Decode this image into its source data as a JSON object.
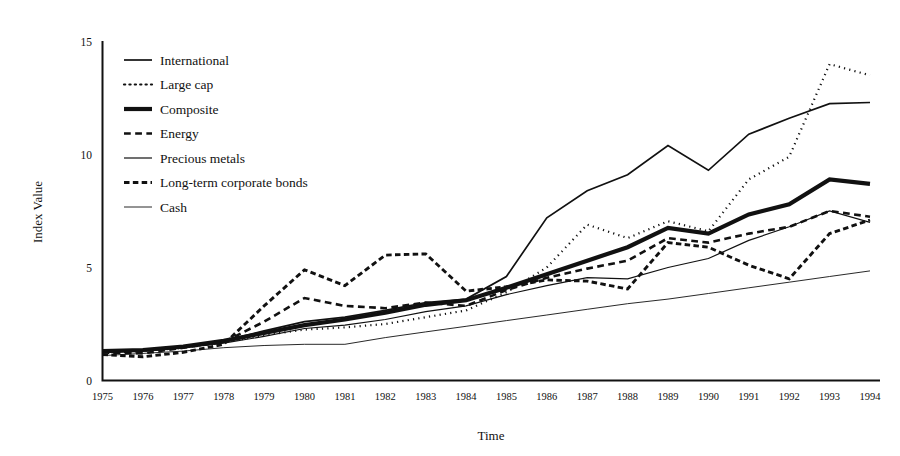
{
  "chart_data": {
    "type": "line",
    "title": "",
    "xlabel": "Time",
    "ylabel": "Index Value",
    "grid": false,
    "legend_position": "upper-left-inside",
    "xlim": [
      1975,
      1994
    ],
    "ylim": [
      0,
      15
    ],
    "yticks": [
      0,
      5,
      10,
      15
    ],
    "x": [
      1975,
      1976,
      1977,
      1978,
      1979,
      1980,
      1981,
      1982,
      1983,
      1984,
      1985,
      1986,
      1987,
      1988,
      1989,
      1990,
      1991,
      1992,
      1993,
      1994
    ],
    "xticks": [
      "1975",
      "1976",
      "1977",
      "1978",
      "1979",
      "1980",
      "1981",
      "1982",
      "1983",
      "1984",
      "1985",
      "1986",
      "1987",
      "1988",
      "1989",
      "1990",
      "1991",
      "1992",
      "1993",
      "1994"
    ],
    "series": [
      {
        "name": "International",
        "style": "solid",
        "width": 1.7,
        "values": [
          1.25,
          1.35,
          1.5,
          1.75,
          2.2,
          2.6,
          2.8,
          3.1,
          3.45,
          3.6,
          4.6,
          7.2,
          8.4,
          9.1,
          10.4,
          9.3,
          10.9,
          11.6,
          12.25,
          12.3
        ]
      },
      {
        "name": "Large cap",
        "style": "dotted",
        "width": 2.2,
        "values": [
          1.2,
          1.3,
          1.45,
          1.7,
          2.0,
          2.25,
          2.35,
          2.5,
          2.8,
          3.1,
          3.9,
          5.0,
          6.9,
          6.3,
          7.05,
          6.6,
          8.9,
          9.9,
          14.0,
          13.5
        ]
      },
      {
        "name": "Composite",
        "style": "solid",
        "width": 4.2,
        "values": [
          1.3,
          1.35,
          1.5,
          1.75,
          2.1,
          2.45,
          2.7,
          3.0,
          3.35,
          3.55,
          4.1,
          4.7,
          5.3,
          5.9,
          6.75,
          6.5,
          7.35,
          7.8,
          8.9,
          8.7
        ]
      },
      {
        "name": "Energy",
        "style": "dashed",
        "width": 2.6,
        "values": [
          1.25,
          1.2,
          1.45,
          1.7,
          2.6,
          3.65,
          3.3,
          3.2,
          3.45,
          3.3,
          4.0,
          4.55,
          4.95,
          5.3,
          6.3,
          6.1,
          6.5,
          6.8,
          7.5,
          7.25
        ]
      },
      {
        "name": "Precious metals",
        "style": "solid",
        "width": 1.2,
        "values": [
          1.25,
          1.3,
          1.45,
          1.65,
          1.95,
          2.3,
          2.45,
          2.7,
          3.05,
          3.3,
          3.8,
          4.2,
          4.55,
          4.5,
          5.0,
          5.4,
          6.2,
          6.8,
          7.5,
          7.0
        ]
      },
      {
        "name": "Long-term corporate bonds",
        "style": "dash-dot-heavy",
        "width": 2.9,
        "values": [
          1.15,
          1.05,
          1.25,
          1.6,
          3.3,
          4.9,
          4.2,
          5.55,
          5.6,
          3.95,
          4.15,
          4.45,
          4.4,
          4.05,
          6.1,
          5.9,
          5.1,
          4.5,
          6.5,
          7.1
        ]
      },
      {
        "name": "Cash",
        "style": "thin-solid",
        "width": 0.9,
        "values": [
          1.1,
          1.2,
          1.3,
          1.45,
          1.55,
          1.6,
          1.6,
          1.9,
          2.15,
          2.4,
          2.65,
          2.9,
          3.15,
          3.4,
          3.6,
          3.85,
          4.1,
          4.35,
          4.6,
          4.85
        ]
      }
    ]
  },
  "legend": {
    "items": [
      {
        "label": "International",
        "swatch": "solid-line-swatch"
      },
      {
        "label": "Large cap",
        "swatch": "dotted-line-swatch"
      },
      {
        "label": "Composite",
        "swatch": "thick-line-swatch"
      },
      {
        "label": "Energy",
        "swatch": "dashed-line-swatch"
      },
      {
        "label": "Precious metals",
        "swatch": "medium-line-swatch"
      },
      {
        "label": "Long-term corporate bonds",
        "swatch": "dash-dot-line-swatch"
      },
      {
        "label": "Cash",
        "swatch": "thin-line-swatch"
      }
    ]
  },
  "colors": {
    "ink": "#111111",
    "background": "#ffffff"
  }
}
